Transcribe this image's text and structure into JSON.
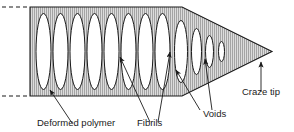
{
  "figure": {
    "background_color": "#ffffff",
    "outline_color": "#1a1a1a",
    "hatch_color": "#9a9a9a",
    "fill_color": "#d6d6d6",
    "void_fill": "#ffffff",
    "leader_color": "#1a1a1a"
  },
  "labels": [
    {
      "id": "deformed-polymer",
      "text": "Deformed polymer",
      "x": 37,
      "y": 126
    },
    {
      "id": "fibrils",
      "text": "Fibrils",
      "x": 137,
      "y": 126
    },
    {
      "id": "voids",
      "text": "Voids",
      "x": 203,
      "y": 117
    },
    {
      "id": "craze-tip",
      "text": "Craze tip",
      "x": 242,
      "y": 95
    }
  ],
  "geometry": {
    "body": {
      "left": 30,
      "top": 7,
      "bottom": 96,
      "shoulder_x": 182,
      "tip_x": 272,
      "tip_y": 51.5
    },
    "dashes": {
      "top_y": 7,
      "bottom_y": 96,
      "x_start": 2,
      "x_end": 30
    },
    "voids": [
      {
        "cx": 43.5,
        "cy": 51.5,
        "rx": 7.5,
        "ry": 38.0
      },
      {
        "cx": 60.5,
        "cy": 51.5,
        "rx": 7.5,
        "ry": 38.0
      },
      {
        "cx": 77.5,
        "cy": 51.5,
        "rx": 7.5,
        "ry": 38.0
      },
      {
        "cx": 94.5,
        "cy": 51.5,
        "rx": 7.5,
        "ry": 38.0
      },
      {
        "cx": 111.5,
        "cy": 51.5,
        "rx": 7.5,
        "ry": 38.0
      },
      {
        "cx": 128.5,
        "cy": 51.5,
        "rx": 7.5,
        "ry": 38.0
      },
      {
        "cx": 145.5,
        "cy": 51.5,
        "rx": 7.5,
        "ry": 38.0
      },
      {
        "cx": 162.5,
        "cy": 51.5,
        "rx": 7.5,
        "ry": 38.0
      },
      {
        "cx": 181.0,
        "cy": 51.5,
        "rx": 6.5,
        "ry": 31.0
      },
      {
        "cx": 196.5,
        "cy": 51.5,
        "rx": 5.0,
        "ry": 23.0
      },
      {
        "cx": 209.5,
        "cy": 51.5,
        "rx": 4.0,
        "ry": 16.0
      },
      {
        "cx": 221.5,
        "cy": 51.5,
        "rx": 3.0,
        "ry": 10.0
      }
    ],
    "leaders": [
      {
        "id": "leader-deformed-polymer",
        "x1": 72,
        "y1": 123,
        "x2": 50,
        "y2": 90,
        "arrow": true
      },
      {
        "id": "leader-fibrils-1",
        "x1": 150,
        "y1": 122,
        "x2": 120,
        "y2": 57,
        "arrow": true
      },
      {
        "id": "leader-fibrils-2",
        "x1": 158,
        "y1": 122,
        "x2": 170,
        "y2": 52,
        "arrow": true
      },
      {
        "id": "leader-voids-1",
        "x1": 200,
        "y1": 110,
        "x2": 176,
        "y2": 70,
        "arrow": true
      },
      {
        "id": "leader-voids-2",
        "x1": 212,
        "y1": 110,
        "x2": 205,
        "y2": 59,
        "arrow": true
      },
      {
        "id": "leader-craze-tip",
        "x1": 261,
        "y1": 92,
        "x2": 261,
        "y2": 62,
        "arrow": true
      }
    ]
  }
}
